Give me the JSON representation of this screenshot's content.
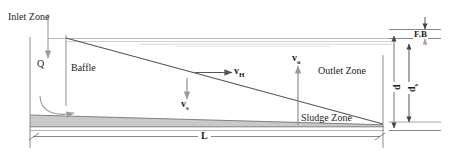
{
  "diagram": {
    "type": "engineering-schematic",
    "labels": {
      "inlet_zone": "Inlet Zone",
      "outlet_zone": "Outlet Zone",
      "sludge_zone": "Sludge Zone",
      "baffle": "Baffle",
      "inflow": "Q",
      "freeboard": "F.B",
      "length": "L",
      "depth_total": "d",
      "depth_settling": "d",
      "depth_settling_sub": "s"
    },
    "vectors": [
      {
        "name": "horizontal-velocity",
        "symbol": "v",
        "subscript": "H",
        "direction": "right"
      },
      {
        "name": "overflow-velocity",
        "symbol": "v",
        "subscript": "o",
        "direction": "up"
      },
      {
        "name": "settling-velocity",
        "symbol": "v",
        "subscript": "s",
        "direction": "down"
      }
    ],
    "colors": {
      "stroke": "#4a4a4a",
      "stroke_light": "#9a9a9a",
      "sludge_fill": "#c8c8c8",
      "water_line": "#b5b5b5",
      "text": "#1b1b1b",
      "background": "#ffffff"
    }
  }
}
